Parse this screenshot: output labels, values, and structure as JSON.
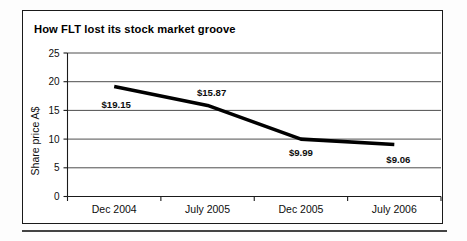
{
  "figure": {
    "title": "How FLT lost its stock market groove"
  },
  "chart_data": {
    "type": "line",
    "title": "How FLT lost its stock market groove",
    "xlabel": "",
    "ylabel": "Share price A$",
    "categories": [
      "Dec 2004",
      "July 2005",
      "Dec 2005",
      "July 2006"
    ],
    "values": [
      19.15,
      15.87,
      9.99,
      9.06
    ],
    "point_labels": [
      "$19.15",
      "$15.87",
      "$9.99",
      "$9.06"
    ],
    "ylim": [
      0,
      25
    ],
    "ytick_labels": [
      "0",
      "5",
      "10",
      "15",
      "20",
      "25"
    ],
    "ytick_values": [
      0,
      5,
      10,
      15,
      20,
      25
    ],
    "grid": "horizontal",
    "legend": "none",
    "series": [
      {
        "name": "FLT share price",
        "values": [
          19.15,
          15.87,
          9.99,
          9.06
        ],
        "color": "#000000"
      }
    ]
  },
  "colors": {
    "line": "#000000",
    "grid": "#3a3a3a",
    "axis": "#1a1a1a",
    "frame": "#1a1a1a",
    "background": "#ffffff"
  }
}
